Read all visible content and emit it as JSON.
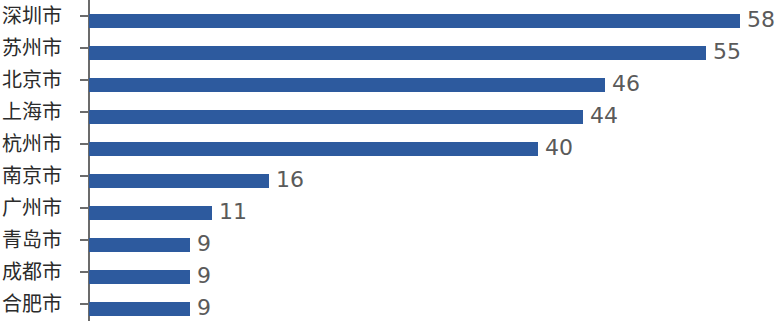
{
  "chart_data": {
    "type": "bar",
    "orientation": "horizontal",
    "title": "",
    "subtitle": "",
    "xlabel": "",
    "ylabel": "",
    "categories": [
      "深圳市",
      "苏州市",
      "北京市",
      "上海市",
      "杭州市",
      "南京市",
      "广州市",
      "青岛市",
      "成都市",
      "合肥市"
    ],
    "values": [
      58,
      55,
      46,
      44,
      40,
      16,
      11,
      9,
      9,
      9
    ],
    "value_labels": [
      "58",
      "55",
      "46",
      "44",
      "40",
      "16",
      "11",
      "9",
      "9",
      "9"
    ],
    "xlim": [
      0,
      58
    ],
    "grid": false,
    "legend": false,
    "data_labels": true,
    "bar_color": "#2d5a9e",
    "label_color": "#2b2b2b",
    "value_label_color": "#5a5a5a",
    "axis_color": "#6b6b6b",
    "background": "#ffffff"
  }
}
